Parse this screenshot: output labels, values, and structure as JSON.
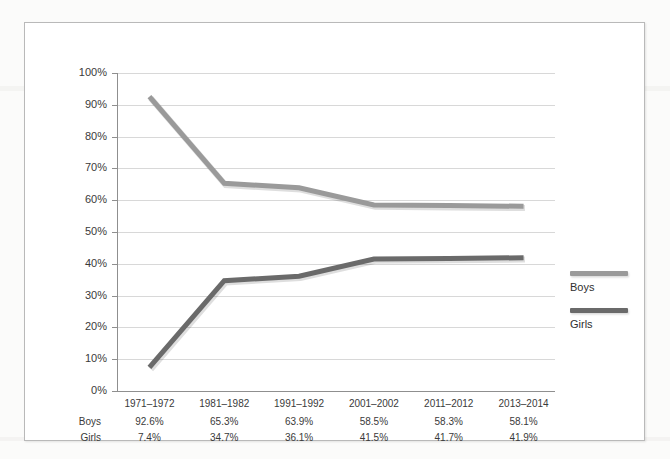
{
  "chart_data": {
    "type": "line",
    "title": "",
    "xlabel": "",
    "ylabel": "",
    "categories": [
      "1971–1972",
      "1981–1982",
      "1991–1992",
      "2001–2002",
      "2011–2012",
      "2013–2014"
    ],
    "series": [
      {
        "name": "Boys",
        "color": "#9a9a9a",
        "values": [
          92.6,
          65.3,
          63.9,
          58.5,
          58.3,
          58.1
        ]
      },
      {
        "name": "Girls",
        "color": "#6a6a6a",
        "values": [
          7.4,
          34.7,
          36.1,
          41.5,
          41.7,
          41.9
        ]
      }
    ],
    "ylim": [
      0,
      100
    ],
    "ytick_values": [
      0,
      10,
      20,
      30,
      40,
      50,
      60,
      70,
      80,
      90,
      100
    ],
    "ytick_labels": [
      "0%",
      "10%",
      "20%",
      "30%",
      "40%",
      "50%",
      "60%",
      "70%",
      "80%",
      "90%",
      "100%"
    ],
    "grid": true,
    "legend_position": "right"
  },
  "legend": {
    "entries": [
      {
        "label": "Boys",
        "color": "#9a9a9a"
      },
      {
        "label": "Girls",
        "color": "#6a6a6a"
      }
    ]
  },
  "data_table": {
    "rows": [
      {
        "label": "Boys",
        "cells": [
          "92.6%",
          "65.3%",
          "63.9%",
          "58.5%",
          "58.3%",
          "58.1%"
        ]
      },
      {
        "label": "Girls",
        "cells": [
          "7.4%",
          "34.7%",
          "36.1%",
          "41.5%",
          "41.7%",
          "41.9%"
        ]
      }
    ]
  }
}
